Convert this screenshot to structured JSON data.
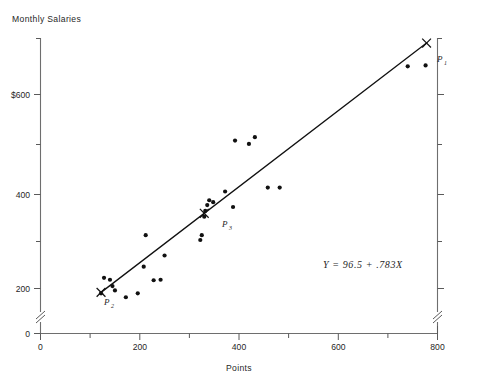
{
  "figure": {
    "title": "Monthly Salaries",
    "xlabel": "Points"
  },
  "annotations": {
    "equation": "Y  =  96.5  +  .783X",
    "p1_label": "P",
    "p1_sub": "1",
    "p2_label": "P",
    "p2_sub": "2",
    "p3_label": "P",
    "p3_sub": "3"
  },
  "ticks": {
    "y": [
      "0",
      "200",
      "400",
      "$600"
    ],
    "x": [
      "0",
      "200",
      "400",
      "600",
      "800"
    ]
  },
  "colors": {
    "background": "#ffffff",
    "ink": "#111111",
    "axis": "#6e6e6e",
    "text": "#1f1f1f"
  },
  "chart_data": {
    "type": "scatter",
    "title": "Monthly Salaries",
    "xlabel": "Points",
    "ylabel": "Monthly Salaries",
    "xlim": [
      0,
      800
    ],
    "ylim": [
      0,
      700
    ],
    "yaxis_break_between": [
      0,
      160
    ],
    "grid": false,
    "legend": null,
    "xticks": [
      0,
      200,
      400,
      600,
      800
    ],
    "xminor_ticks": [
      100,
      300,
      500,
      700
    ],
    "yticks": [
      0,
      200,
      400,
      600
    ],
    "ytick_labels": [
      "0",
      "200",
      "400",
      "$600"
    ],
    "yminor_ticks": [
      300,
      500,
      700
    ],
    "points": [
      {
        "x": 122,
        "y": 190
      },
      {
        "x": 128,
        "y": 222
      },
      {
        "x": 140,
        "y": 218
      },
      {
        "x": 145,
        "y": 205
      },
      {
        "x": 150,
        "y": 196
      },
      {
        "x": 172,
        "y": 182
      },
      {
        "x": 196,
        "y": 190
      },
      {
        "x": 208,
        "y": 245
      },
      {
        "x": 212,
        "y": 310
      },
      {
        "x": 228,
        "y": 217
      },
      {
        "x": 242,
        "y": 218
      },
      {
        "x": 250,
        "y": 268
      },
      {
        "x": 322,
        "y": 300
      },
      {
        "x": 325,
        "y": 310
      },
      {
        "x": 330,
        "y": 348
      },
      {
        "x": 332,
        "y": 360
      },
      {
        "x": 336,
        "y": 372
      },
      {
        "x": 340,
        "y": 382
      },
      {
        "x": 348,
        "y": 378
      },
      {
        "x": 372,
        "y": 400
      },
      {
        "x": 388,
        "y": 368
      },
      {
        "x": 392,
        "y": 505
      },
      {
        "x": 420,
        "y": 498
      },
      {
        "x": 432,
        "y": 512
      },
      {
        "x": 458,
        "y": 408
      },
      {
        "x": 482,
        "y": 408
      },
      {
        "x": 740,
        "y": 658
      },
      {
        "x": 776,
        "y": 660
      }
    ],
    "regression_line": {
      "equation": "Y = 96.5 + .783X",
      "intercept": 96.5,
      "slope": 0.783,
      "x_start": 122,
      "x_end": 778,
      "y_start": 192,
      "y_end": 706
    },
    "marked_points": [
      {
        "name": "P1",
        "x": 778,
        "y": 706,
        "marker": "x"
      },
      {
        "name": "P2",
        "x": 122,
        "y": 192,
        "marker": "x"
      },
      {
        "name": "P3",
        "x": 330,
        "y": 355,
        "marker": "x"
      }
    ]
  }
}
